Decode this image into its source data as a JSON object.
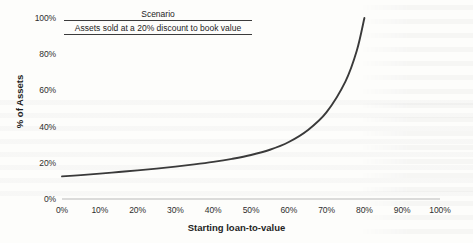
{
  "chart_data": {
    "type": "line",
    "title": "Scenario",
    "subtitle": "Assets sold at a 20% discount to book value",
    "xlabel": "Starting loan-to-value",
    "ylabel": "% of Assets",
    "xlim": [
      0,
      100
    ],
    "ylim": [
      0,
      100
    ],
    "grid": false,
    "legend_position": "none",
    "xticks": [
      "0%",
      "10%",
      "20%",
      "30%",
      "40%",
      "50%",
      "60%",
      "70%",
      "80%",
      "90%",
      "100%"
    ],
    "yticks": [
      "0%",
      "20%",
      "40%",
      "60%",
      "80%",
      "100%"
    ],
    "series": [
      {
        "name": "Assets sold at a 20% discount to book value",
        "color": "#3a3a3a",
        "x": [
          0,
          5,
          10,
          15,
          20,
          25,
          30,
          35,
          40,
          45,
          50,
          55,
          60,
          65,
          70,
          75,
          78,
          80
        ],
        "values": [
          12.5,
          13.2,
          14.0,
          14.9,
          15.8,
          16.8,
          17.9,
          19.1,
          20.5,
          22.2,
          24.3,
          27.2,
          31.5,
          38.0,
          48.0,
          65.0,
          82.0,
          100.0
        ]
      }
    ]
  },
  "axes": {
    "y_label": "% of Assets",
    "x_label": "Starting loan-to-value"
  }
}
